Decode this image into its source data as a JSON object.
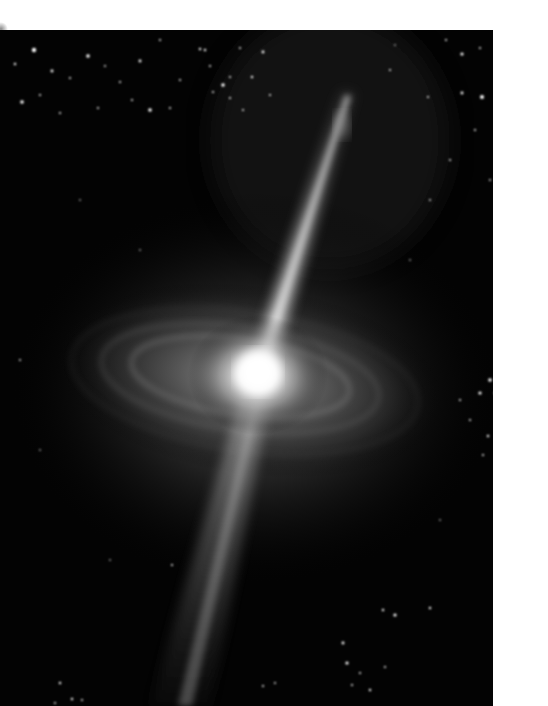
{
  "image": {
    "subject": "galaxy-with-relativistic-jets",
    "description": "Illustration of an active galactic nucleus: bright central core with a glowing accretion disk and two opposing jets against a starfield",
    "colors": {
      "background_margin": "#ffffff",
      "space": "#030303",
      "core": "#ffffff",
      "disk_glow": "#9a9a9a",
      "jet": "#d8d8d8",
      "stars": "#ffffff"
    },
    "frame": {
      "left": 0,
      "top": 30,
      "width": 493,
      "height": 676
    },
    "core": {
      "cx": 258,
      "cy": 370
    },
    "upper_jet": {
      "from": [
        258,
        370
      ],
      "to": [
        352,
        80
      ]
    },
    "lower_jet": {
      "from": [
        258,
        370
      ],
      "to": [
        180,
        706
      ]
    },
    "disk": {
      "cx": 250,
      "cy": 380,
      "rx": 200,
      "ry": 95,
      "rotation": 8
    }
  }
}
